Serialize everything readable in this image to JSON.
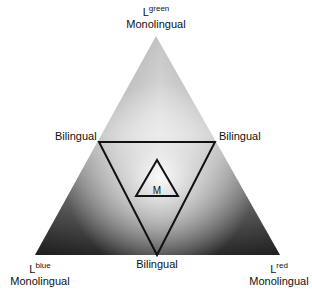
{
  "diagram": {
    "type": "ternary-language-triangle",
    "vertices": {
      "top": {
        "base": "L",
        "superscript": "green",
        "label": "Monolingual"
      },
      "bottom_left": {
        "base": "L",
        "superscript": "blue",
        "label": "Monolingual"
      },
      "bottom_right": {
        "base": "L",
        "superscript": "red",
        "label": "Monolingual"
      }
    },
    "edge_midpoints": {
      "left": "Bilingual",
      "right": "Bilingual",
      "bottom": "Bilingual"
    },
    "center_label": "M",
    "colors": {
      "light": "#f4f4f4",
      "mid": "#b8b8b8",
      "dark": "#2a2a2a",
      "stroke": "#111111"
    }
  }
}
